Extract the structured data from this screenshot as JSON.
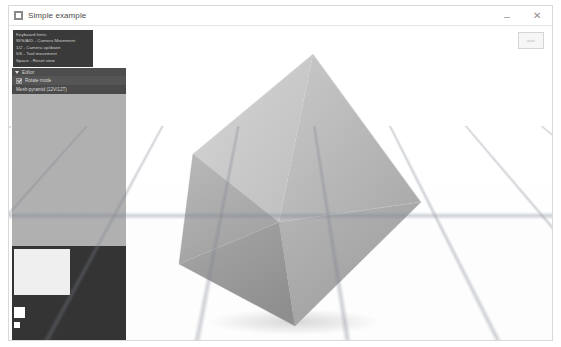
{
  "window": {
    "title": "Simple example",
    "icon": "app-window-icon",
    "controls": {
      "minimize": "–",
      "close": "✕"
    }
  },
  "hints": {
    "title": "Keyboard hints:",
    "lines": [
      "W/S/A/D - Camera Movement",
      "1/2 - Camera up/down",
      "5/6 - Tool movement",
      "Space - Reset view"
    ]
  },
  "editor": {
    "header": "Editor",
    "rows": [
      {
        "label": "Rotate mode",
        "checked": true
      },
      {
        "label": "Mesh-pyramid (12V/12T)",
        "selected": true
      }
    ]
  },
  "gizmo": {
    "label": "axis"
  },
  "scene": {
    "object": "octahedron",
    "grid": "perspective-floor-grid",
    "colors": {
      "background": "#ffffff",
      "grid_line": "#78808c",
      "face_light": "#c6c6c6",
      "face_mid": "#b0b0b0",
      "face_dark": "#9c9c9c",
      "face_darkest": "#8e8e8e",
      "panel_dark": "#3a3a3a",
      "panel_gray": "#b4b4b4",
      "accent_row": "#4a4a4a"
    }
  }
}
